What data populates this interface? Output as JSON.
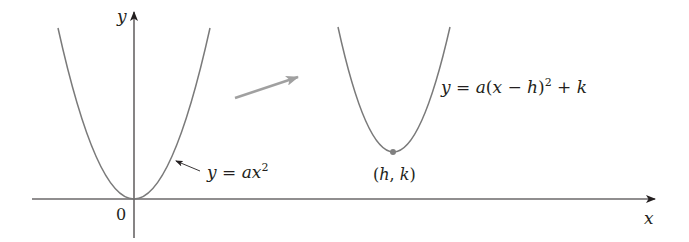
{
  "colors": {
    "background": "#ffffff",
    "axis": "#231f20",
    "curve": "#7a7a7a",
    "vertex_point": "#808080",
    "shift_arrow": "#a0a0a0"
  },
  "axes": {
    "x_label": "x",
    "y_label": "y",
    "origin_label": "0"
  },
  "curves": [
    {
      "name": "base-parabola",
      "equation_label": "y = ax²",
      "label_parts": {
        "lhs": "y",
        "eq": " = ",
        "a": "a",
        "x": "x",
        "exp": "2"
      },
      "vertex": [
        0,
        0
      ]
    },
    {
      "name": "shifted-parabola",
      "equation_label": "y = a(x − h)² + k",
      "label_parts": {
        "lhs": "y",
        "eq": " = ",
        "a": "a",
        "open": "(",
        "x": "x",
        "minus": " − ",
        "h": "h",
        "close": ")",
        "exp": "2",
        "plus": " + ",
        "k": "k"
      },
      "vertex_label": "(h, k)",
      "vertex_label_parts": {
        "open": "(",
        "h": "h",
        "comma": ", ",
        "k": "k",
        "close": ")"
      }
    }
  ],
  "annotations": {
    "translation_arrow": "shift from y = ax² to y = a(x − h)² + k"
  }
}
